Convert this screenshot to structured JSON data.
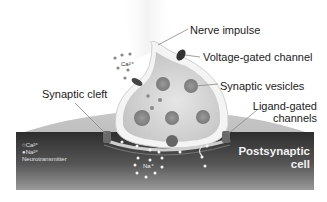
{
  "diagram": {
    "labels": {
      "nerve_impulse": "Nerve impulse",
      "voltage_gated_channel": "Voltage-gated channel",
      "synaptic_vesicles": "Synaptic vesicles",
      "synaptic_cleft": "Synaptic cleft",
      "ligand_gated_channels_line1": "Ligand-gated",
      "ligand_gated_channels_line2": "channels",
      "postsynaptic_cell_line1": "Postsynaptic",
      "postsynaptic_cell_line2": "cell"
    },
    "ions": {
      "calcium": "Ca²⁺",
      "sodium": "Na⁺"
    },
    "legend": {
      "items": [
        {
          "symbol": "○",
          "label": "Ca²⁺"
        },
        {
          "symbol": "●",
          "label": "Na²⁺"
        },
        {
          "symbol": "",
          "label": "Neurotransmitter"
        }
      ]
    },
    "colors": {
      "postsynaptic_dark": "#3a3a3a",
      "postsynaptic_light": "#7a7a7a",
      "presynaptic_fill": "#d8d8d8",
      "membrane_light": "#f4f4f4",
      "vesicle": "#8c8c8c",
      "label_text": "#222222"
    }
  }
}
